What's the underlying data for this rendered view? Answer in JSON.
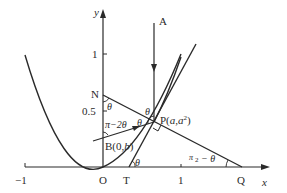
{
  "diagram": {
    "axes": {
      "x_label": "x",
      "y_label": "y",
      "x_ticks": [
        {
          "value": "-1",
          "label": "−1"
        },
        {
          "value": "1",
          "label": "1"
        }
      ],
      "y_ticks": [
        {
          "value": "1",
          "label": "1"
        },
        {
          "value": "0.5",
          "label": "0.5"
        }
      ]
    },
    "points": {
      "origin": "O",
      "T": "T",
      "Q": "Q",
      "N": "N",
      "A": "A",
      "P": "P(a,a²)",
      "P_base": "P(",
      "P_a": "a",
      "P_comma": ",",
      "P_a2": "a",
      "P_sup": "2",
      "P_close": ")",
      "B_base": "B(0,",
      "B_b": "b",
      "B_close": ")"
    },
    "angles": {
      "theta_N": "θ",
      "theta_P_top": "θ",
      "theta_P_left": "θ",
      "pi_minus_2theta": "π−2θ",
      "theta_T": "θ",
      "half_pi_minus_theta_num": "π",
      "half_pi_minus_theta_den": "2",
      "half_pi_minus_theta_rest": "− θ"
    },
    "colors": {
      "stroke": "#2a2a2a",
      "background": "#ffffff"
    }
  }
}
